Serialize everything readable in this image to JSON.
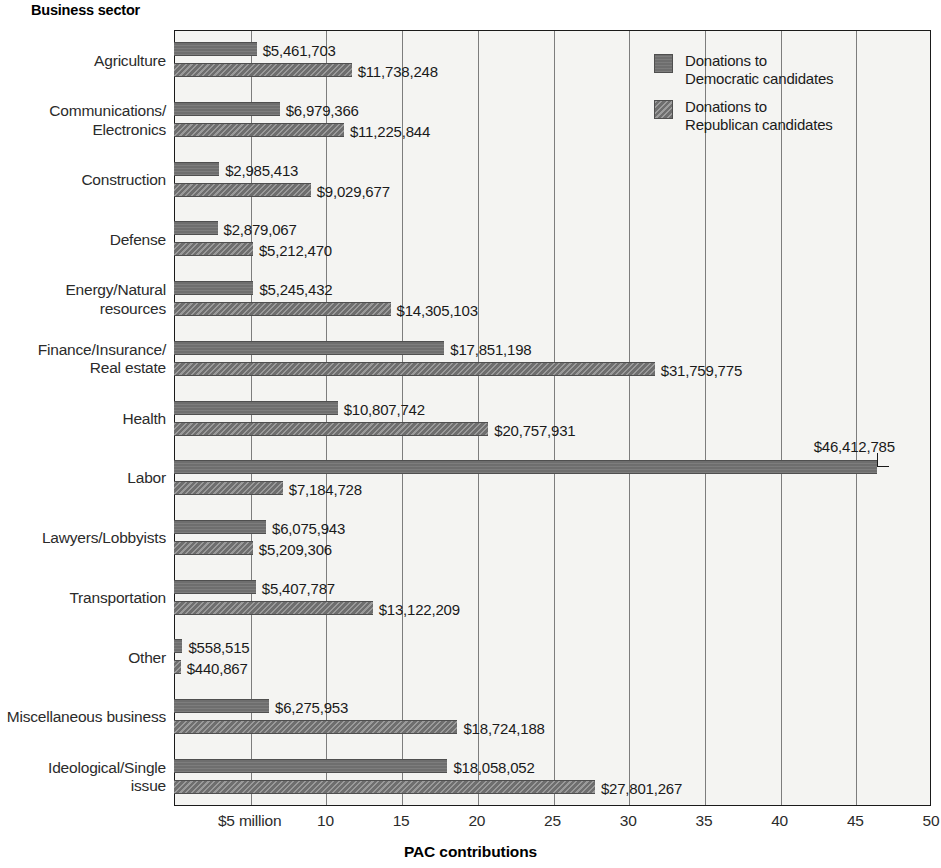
{
  "axis_title_y": "Business sector",
  "axis_title_x": "PAC contributions",
  "legend": {
    "items": [
      {
        "key": "dem",
        "label": "Donations to\nDemocratic candidates"
      },
      {
        "key": "rep",
        "label": "Donations to\nRepublican candidates"
      }
    ]
  },
  "xticks": [
    {
      "value": 5,
      "label": "$5 million"
    },
    {
      "value": 10,
      "label": "10"
    },
    {
      "value": 15,
      "label": "15"
    },
    {
      "value": 20,
      "label": "20"
    },
    {
      "value": 25,
      "label": "25"
    },
    {
      "value": 30,
      "label": "30"
    },
    {
      "value": 35,
      "label": "35"
    },
    {
      "value": 40,
      "label": "40"
    },
    {
      "value": 45,
      "label": "45"
    },
    {
      "value": 50,
      "label": "50"
    }
  ],
  "chart_data": {
    "type": "bar",
    "orientation": "horizontal",
    "title": "",
    "xlabel": "PAC contributions",
    "ylabel": "Business sector",
    "xlim": [
      0,
      50
    ],
    "x_units": "millions of dollars",
    "grid": true,
    "legend_position": "top-right",
    "categories": [
      "Agriculture",
      "Communications/\nElectronics",
      "Construction",
      "Defense",
      "Energy/Natural\nresources",
      "Finance/Insurance/\nReal estate",
      "Health",
      "Labor",
      "Lawyers/Lobbyists",
      "Transportation",
      "Other",
      "Miscellaneous business",
      "Ideological/Single\nissue"
    ],
    "series": [
      {
        "name": "Donations to Democratic candidates",
        "key": "dem",
        "values": [
          5461703,
          6979366,
          2985413,
          2879067,
          5245432,
          17851198,
          10807742,
          46412785,
          6075943,
          5407787,
          558515,
          6275953,
          18058052
        ],
        "labels": [
          "$5,461,703",
          "$6,979,366",
          "$2,985,413",
          "$2,879,067",
          "$5,245,432",
          "$17,851,198",
          "$10,807,742",
          "$46,412,785",
          "$6,075,943",
          "$5,407,787",
          "$558,515",
          "$6,275,953",
          "$18,058,052"
        ]
      },
      {
        "name": "Donations to Republican candidates",
        "key": "rep",
        "values": [
          11738248,
          11225844,
          9029677,
          5212470,
          14305103,
          31759775,
          20757931,
          7184728,
          5209306,
          13122209,
          440867,
          18724188,
          27801267
        ],
        "labels": [
          "$11,738,248",
          "$11,225,844",
          "$9,029,677",
          "$5,212,470",
          "$14,305,103",
          "$31,759,775",
          "$20,757,931",
          "$7,184,728",
          "$5,209,306",
          "$13,122,209",
          "$440,867",
          "$18,724,188",
          "$27,801,267"
        ]
      }
    ]
  },
  "colors": {
    "bar": "#6e6e6e",
    "plot_background": "#f4f4f2",
    "grid": "#7d7d7d",
    "text": "#1a1a1a"
  }
}
